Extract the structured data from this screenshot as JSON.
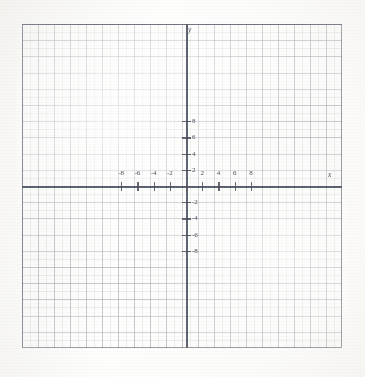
{
  "figure": {
    "kind": "cartesian-coordinate-grid",
    "appearance": "photocopied-worksheet",
    "paper_color": "#fdfdfc",
    "grid_line_color": "#787e8c",
    "axis_color": "#484e5c"
  },
  "axes": {
    "x_name": "x",
    "y_name": "y"
  },
  "chart_data": {
    "type": "scatter",
    "title": "",
    "subtitle": "",
    "xlabel": "x",
    "ylabel": "y",
    "xlim": [
      -10.25,
      9.75
    ],
    "ylim": [
      -10.1,
      10.0
    ],
    "grid": true,
    "minor_grid": true,
    "major_tick_step": 2,
    "minor_tick_step": 1,
    "legend": null,
    "legend_position": "none",
    "annotations": [],
    "series": [],
    "x": [],
    "values": [],
    "x_tick_labels": [
      "-8",
      "-6",
      "-4",
      "-2",
      "2",
      "4",
      "6",
      "8"
    ],
    "x_tick_values": [
      -8,
      -6,
      -4,
      -2,
      2,
      4,
      6,
      8
    ],
    "y_tick_labels": [
      "8",
      "6",
      "4",
      "2",
      "-2",
      "-4",
      "-6",
      "-8"
    ],
    "y_tick_values": [
      8,
      6,
      4,
      2,
      -2,
      -4,
      -6,
      -8
    ]
  },
  "x_ticks": [
    {
      "label": "-8",
      "value": -8
    },
    {
      "label": "-6",
      "value": -6
    },
    {
      "label": "-4",
      "value": -4
    },
    {
      "label": "-2",
      "value": -2
    },
    {
      "label": "2",
      "value": 2
    },
    {
      "label": "4",
      "value": 4
    },
    {
      "label": "6",
      "value": 6
    },
    {
      "label": "8",
      "value": 8
    }
  ],
  "y_ticks": [
    {
      "label": "8",
      "value": 8
    },
    {
      "label": "6",
      "value": 6
    },
    {
      "label": "4",
      "value": 4
    },
    {
      "label": "2",
      "value": 2
    },
    {
      "label": "-2",
      "value": -2
    },
    {
      "label": "-4",
      "value": -4
    },
    {
      "label": "-6",
      "value": -6
    },
    {
      "label": "-8",
      "value": -8
    }
  ]
}
